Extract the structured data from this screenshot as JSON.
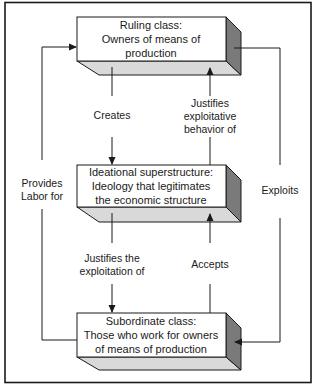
{
  "diagram": {
    "type": "flow",
    "colors": {
      "border": "#1a1a1a",
      "front_face": "#ffffff",
      "side_face": "#7a7a7a",
      "bottom_face": "#d9d9d9",
      "line": "#1a1a1a"
    },
    "nodes": [
      {
        "id": "ruling",
        "lines": [
          "Ruling class:",
          "Owners of means of",
          "production"
        ]
      },
      {
        "id": "ideational",
        "lines": [
          "Ideational superstructure:",
          "Ideology that legitimates",
          "the economic structure"
        ]
      },
      {
        "id": "subordinate",
        "lines": [
          "Subordinate class:",
          "Those who work for owners",
          "of means of production"
        ]
      }
    ],
    "edges": [
      {
        "from": "ruling",
        "to": "ideational",
        "lines": [
          "Creates"
        ]
      },
      {
        "from": "ideational",
        "to": "ruling",
        "lines": [
          "Justifies",
          "exploitative",
          "behavior of"
        ]
      },
      {
        "from": "ideational",
        "to": "subordinate",
        "lines": [
          "Justifies the",
          "exploitation of"
        ]
      },
      {
        "from": "subordinate",
        "to": "ideational",
        "lines": [
          "Accepts"
        ]
      },
      {
        "from": "subordinate",
        "to": "ruling",
        "lines": [
          "Provides",
          "Labor for"
        ]
      },
      {
        "from": "ruling",
        "to": "subordinate",
        "lines": [
          "Exploits"
        ]
      }
    ]
  }
}
